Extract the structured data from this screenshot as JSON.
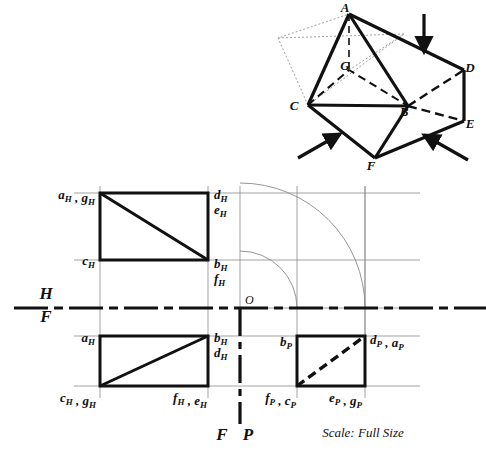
{
  "sheet": {
    "background": "#ffffff",
    "ink": "#111111",
    "construction_color": "#8a8a8a",
    "scale_note": "Scale: Full Size"
  },
  "pictorial": {
    "title": "isometric-prism-with-pyramid",
    "vertices": [
      {
        "id": "A",
        "label": "A",
        "x": 349,
        "y": 14,
        "lx": 345,
        "ly": 12
      },
      {
        "id": "B",
        "label": "B",
        "x": 408,
        "y": 106,
        "lx": 404,
        "ly": 116
      },
      {
        "id": "C",
        "label": "C",
        "x": 308,
        "y": 105,
        "lx": 294,
        "ly": 110
      },
      {
        "id": "D",
        "label": "D",
        "x": 464,
        "y": 70,
        "lx": 470,
        "ly": 72
      },
      {
        "id": "E",
        "label": "E",
        "x": 464,
        "y": 121,
        "lx": 470,
        "ly": 128
      },
      {
        "id": "F",
        "label": "F",
        "x": 375,
        "y": 158,
        "lx": 371,
        "ly": 170
      },
      {
        "id": "G",
        "label": "G",
        "x": 349,
        "y": 70,
        "lx": 345,
        "ly": 70
      }
    ],
    "arrows": [
      {
        "name": "top-arrow",
        "x1": 424,
        "y1": 14,
        "x2": 424,
        "y2": 52
      },
      {
        "name": "left-front-arrow",
        "x1": 298,
        "y1": 158,
        "x2": 340,
        "y2": 134
      },
      {
        "name": "right-front-arrow",
        "x1": 468,
        "y1": 160,
        "x2": 424,
        "y2": 135
      }
    ]
  },
  "top_view": {
    "name": "horizontal-projection",
    "rect": {
      "x": 100,
      "y": 193,
      "w": 108,
      "h": 67
    },
    "diagonal": {
      "x1": 100,
      "y1": 193,
      "x2": 208,
      "y2": 260
    },
    "labels": [
      {
        "id": "ah-gh",
        "base": "a",
        "sub": "H",
        "text": "a",
        "sub2": "H",
        "full": "aₕ , gₕ",
        "x": 56,
        "y": 196
      },
      {
        "id": "ch",
        "full": "cₕ",
        "x": 78,
        "y": 263
      },
      {
        "id": "dh",
        "full": "dₕ",
        "x": 213,
        "y": 196
      },
      {
        "id": "eh",
        "full": "eₕ",
        "x": 213,
        "y": 211
      },
      {
        "id": "bh",
        "full": "bₕ",
        "x": 213,
        "y": 266
      },
      {
        "id": "fh",
        "full": "fₕ",
        "x": 213,
        "y": 281
      }
    ]
  },
  "front_view": {
    "name": "frontal-projection",
    "rect": {
      "x": 100,
      "y": 336,
      "w": 108,
      "h": 50
    },
    "diagonal": {
      "x1": 100,
      "y1": 386,
      "x2": 208,
      "y2": 336
    },
    "labels": [
      {
        "id": "af",
        "full": "aₕ",
        "x": 80,
        "y": 340
      },
      {
        "id": "cf-gf",
        "full": "cₕ , gₕ",
        "x": 62,
        "y": 402
      },
      {
        "id": "bf",
        "full": "bₕ",
        "x": 213,
        "y": 340
      },
      {
        "id": "df",
        "full": "dₕ",
        "x": 213,
        "y": 355
      },
      {
        "id": "ff-ef",
        "full": "fₕ , eₕ",
        "x": 162,
        "y": 402
      }
    ]
  },
  "profile_view": {
    "name": "profile-projection",
    "rect": {
      "x": 297,
      "y": 336,
      "w": 68,
      "h": 50
    },
    "diagonal_hidden": {
      "x1": 297,
      "y1": 386,
      "x2": 365,
      "y2": 336
    },
    "labels": [
      {
        "id": "bp",
        "full": "bₚ",
        "x": 272,
        "y": 344
      },
      {
        "id": "dp-ap",
        "full": "dₚ , aₚ",
        "x": 370,
        "y": 342
      },
      {
        "id": "fp-cp",
        "full": "fₚ , cₚ",
        "x": 272,
        "y": 402
      },
      {
        "id": "ep-gp",
        "full": "eₚ , gₚ",
        "x": 334,
        "y": 402
      }
    ]
  },
  "fold_lines": {
    "hf": {
      "name": "h-f-fold-line",
      "y": 308,
      "x1": 14,
      "x2": 486,
      "label_top": "H",
      "label_bottom": "F",
      "label_x": 46,
      "label_top_y": 299,
      "label_bottom_y": 322
    },
    "fp": {
      "name": "f-p-fold-line",
      "x": 240,
      "y1": 308,
      "y2": 424,
      "label_left": "F",
      "label_right": "P",
      "label_y": 440,
      "label_left_x": 222,
      "label_right_x": 248
    },
    "origin": {
      "label": "O",
      "x": 245,
      "y": 304
    }
  },
  "arcs": [
    {
      "name": "outer-miter-arc",
      "cx": 240,
      "cy": 308,
      "r": 125
    },
    {
      "name": "inner-miter-arc",
      "cx": 240,
      "cy": 308,
      "r": 57
    }
  ],
  "construction_lines": {
    "horizontal": [
      193,
      260,
      336,
      386
    ],
    "vertical": [
      100,
      208,
      297,
      365
    ]
  }
}
